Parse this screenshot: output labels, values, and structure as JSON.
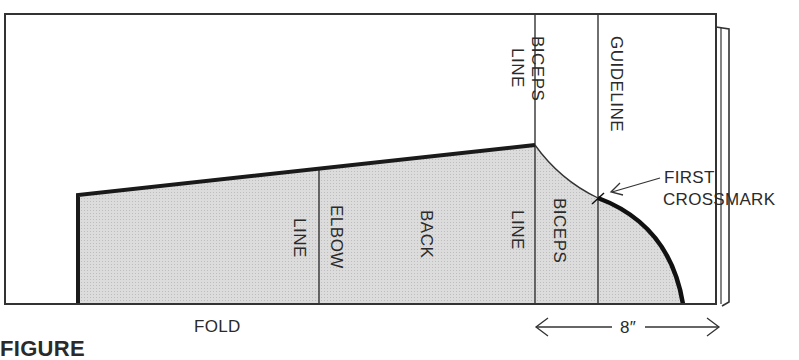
{
  "diagram": {
    "type": "sleeve pattern drafting diagram",
    "labels": {
      "biceps_line_top_word1": "BICEPS",
      "biceps_line_top_word2": "LINE",
      "guideline": "GUIDELINE",
      "first_crossmark_1": "FIRST",
      "first_crossmark_2": "CROSSMARK",
      "elbow_line_word1": "ELBOW",
      "elbow_line_word2": "LINE",
      "back": "BACK",
      "biceps_line_bottom_word1": "BICEPS",
      "biceps_line_bottom_word2": "LINE",
      "fold": "FOLD",
      "measurement": "8″",
      "caption_cut": "FIGURE"
    },
    "colors": {
      "line": "#222222",
      "shade": "#d6d6d6",
      "background": "#ffffff"
    }
  }
}
